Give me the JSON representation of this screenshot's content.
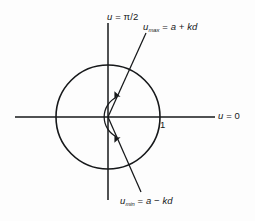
{
  "figure": {
    "background_color": "#fdfdfd",
    "stroke_color": "#16181a",
    "labels": {
      "vertical_axis": {
        "text": "u = π/2",
        "var": "u",
        "op": " = ",
        "value": "π/2"
      },
      "horizontal_axis": {
        "text": "u = 0",
        "var": "u",
        "op": " = ",
        "value": "0"
      },
      "upper_ray": {
        "text": "u_max = a + kd",
        "var": "u",
        "sub": "max",
        "op": " = ",
        "value": "a + kd"
      },
      "lower_ray": {
        "text": "u_min = a − kd",
        "var": "u",
        "sub": "min",
        "op": " = ",
        "value": "a − kd"
      },
      "unit_tick": {
        "text": "1"
      }
    },
    "geometry": {
      "origin": {
        "x": 108,
        "y": 117
      },
      "circle_radius": 52,
      "horizontal_axis": {
        "x1": 15,
        "y1": 117,
        "x2": 215,
        "y2": 117
      },
      "vertical_axis": {
        "x1": 108,
        "y1": 23,
        "x2": 108,
        "y2": 200
      },
      "upper_ray": {
        "x1": 108,
        "y1": 117,
        "x2": 146,
        "y2": 33
      },
      "lower_ray": {
        "x1": 108,
        "y1": 117,
        "x2": 141,
        "y2": 192
      },
      "arc_arrow": {
        "description": "double-headed arc spanning from the lower ray to the upper ray",
        "radius": 22,
        "start_angle_deg": -66,
        "end_angle_deg": 66
      }
    }
  }
}
